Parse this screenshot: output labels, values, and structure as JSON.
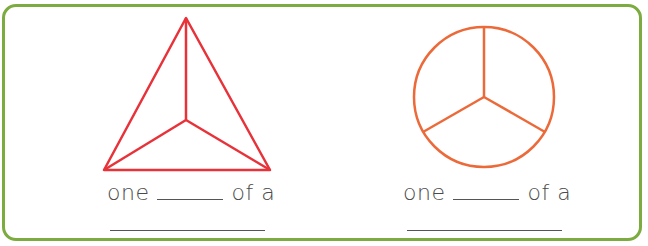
{
  "worksheet": {
    "border_color": "#7cab3f",
    "items": [
      {
        "shape": "triangle",
        "stroke_color": "#e8323a",
        "parts": 3,
        "caption_prefix": "one",
        "caption_suffix": "of a",
        "blank_1": "",
        "blank_2": ""
      },
      {
        "shape": "circle",
        "stroke_color": "#ec6a3a",
        "parts": 3,
        "caption_prefix": "one",
        "caption_suffix": "of a",
        "blank_1": "",
        "blank_2": ""
      }
    ]
  }
}
